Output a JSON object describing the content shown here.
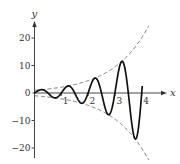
{
  "chart_data": {
    "type": "line",
    "title": "",
    "xlabel": "x",
    "ylabel": "y",
    "xlim": [
      0,
      4.3
    ],
    "ylim": [
      -22,
      25
    ],
    "grid": false,
    "legend": null,
    "x_ticks": [
      1,
      2,
      3,
      4
    ],
    "x_tick_labels": [
      "1",
      "2",
      "3",
      "4"
    ],
    "y_ticks": [
      20,
      10,
      0,
      -10,
      -20
    ],
    "y_tick_labels": [
      "20",
      "10",
      "0",
      "−10",
      "−20"
    ],
    "series": [
      {
        "name": "oscillation",
        "style": "solid",
        "expression": "e^(0.75x)·sin(2πx)",
        "domain": [
          0,
          4.02
        ],
        "key_points": [
          {
            "x": 0.25,
            "y": 1.2
          },
          {
            "x": 0.75,
            "y": -1.8
          },
          {
            "x": 1.25,
            "y": 2.6
          },
          {
            "x": 1.75,
            "y": -3.7
          },
          {
            "x": 2.25,
            "y": 5.4
          },
          {
            "x": 2.75,
            "y": -7.9
          },
          {
            "x": 3.25,
            "y": 11.5
          },
          {
            "x": 3.75,
            "y": -16.6
          }
        ]
      },
      {
        "name": "upper envelope",
        "style": "dashed",
        "expression": "e^(0.75x)",
        "domain": [
          0,
          4.26
        ]
      },
      {
        "name": "lower envelope",
        "style": "dashed",
        "expression": "-e^(0.75x)",
        "domain": [
          0,
          4.26
        ]
      }
    ],
    "layout": {
      "origin_px": [
        34.5,
        93
      ],
      "x_unit_px": 26.8,
      "y_unit_px": 2.75,
      "x_axis_end_px": 167,
      "y_axis_top_px": 21,
      "y_axis_bottom_px": 158
    }
  },
  "colors": {
    "axis": "#444444",
    "curve": "#111111",
    "envelope": "#666666",
    "background": "#ffffff"
  }
}
